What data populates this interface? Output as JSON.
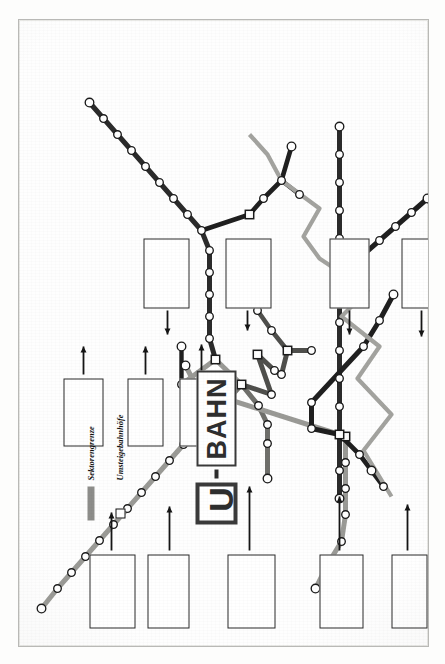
{
  "document": {
    "title": "U-Bahn",
    "subtitle": "BAHN",
    "orientation": "rotated-90-ccw",
    "paper_color": "#fefefe",
    "ink_color": "#1d1d1d"
  },
  "legend": {
    "items": [
      {
        "symbol": "bar",
        "label": "Sektorengrenze",
        "color": "#8d8d8a"
      },
      {
        "symbol": "square",
        "label": "Umsteigebahnhöfe",
        "color": "#111111"
      }
    ]
  },
  "lines": [
    {
      "id": "A",
      "name": "Linie A",
      "color": "#9a9a96",
      "stroke": 5.0
    },
    {
      "id": "B",
      "name": "Linie B",
      "color": "#4f4f4c",
      "stroke": 5.0
    },
    {
      "id": "C",
      "name": "Linie C",
      "color": "#2b2b2b",
      "stroke": 5.0
    },
    {
      "id": "D",
      "name": "Linie D",
      "color": "#6f6f6b",
      "stroke": 5.0
    },
    {
      "id": "E",
      "name": "Linie E",
      "color": "#1f1f1f",
      "stroke": 5.0
    },
    {
      "id": "SEKTOR",
      "name": "Sektorengrenze",
      "color": "#a3a39f",
      "stroke": 4.0
    }
  ],
  "stations": [
    {
      "name": "Krumme Lanke",
      "x": 38,
      "y": 22,
      "type": "end",
      "lbl": "above",
      "u": true
    },
    {
      "name": "Onkel Toms Hütte",
      "x": 58,
      "y": 38,
      "type": "stop",
      "lbl": "above"
    },
    {
      "name": "Oskar-Helene-Heim",
      "x": 74,
      "y": 52,
      "type": "stop",
      "lbl": "above"
    },
    {
      "name": "Thielplatz",
      "x": 90,
      "y": 66,
      "type": "stop",
      "lbl": "above"
    },
    {
      "name": "Dahlem-Dorf",
      "x": 106,
      "y": 80,
      "type": "stop",
      "lbl": "above"
    },
    {
      "name": "Podbielskiallee",
      "x": 122,
      "y": 94,
      "type": "stop",
      "lbl": "above"
    },
    {
      "name": "Breitenbachpl.",
      "x": 138,
      "y": 108,
      "type": "stop",
      "lbl": "above"
    },
    {
      "name": "Rüdesheimer Pl.",
      "x": 154,
      "y": 122,
      "type": "stop",
      "lbl": "above"
    },
    {
      "name": "Heidelberger Pl.",
      "x": 170,
      "y": 136,
      "type": "stop",
      "lbl": "above"
    },
    {
      "name": "Fehrbelliner Pl.",
      "x": 186,
      "y": 150,
      "type": "stop",
      "lbl": "above"
    },
    {
      "name": "Hohenzollernpl.",
      "x": 202,
      "y": 164,
      "type": "stop",
      "lbl": "above"
    },
    {
      "name": "Spichernstr.",
      "x": 222,
      "y": 181,
      "type": "xchg",
      "lbl": "above",
      "u": true
    },
    {
      "name": "Kurfürstendamm",
      "x": 252,
      "y": 181,
      "type": "xchg",
      "lbl": "above",
      "u": true
    },
    {
      "name": "Uhlandstr.",
      "x": 281,
      "y": 166,
      "type": "end",
      "lbl": "above",
      "u": true
    },
    {
      "name": "Augsburger S.",
      "x": 243,
      "y": 205,
      "type": "stop",
      "lbl": "below"
    },
    {
      "name": "Wittenbergpl.",
      "x": 262,
      "y": 222,
      "type": "xchg",
      "lbl": "below",
      "u": true
    },
    {
      "name": "Nollendorfpl.",
      "x": 292,
      "y": 238,
      "type": "xchg",
      "lbl": "below",
      "u": true
    },
    {
      "name": "Kurfürstenstr.",
      "x": 276,
      "y": 255,
      "type": "stop",
      "lbl": "below"
    },
    {
      "name": "Bülowstr.",
      "x": 252,
      "y": 252,
      "type": "stop",
      "lbl": "below"
    },
    {
      "name": "Viktoria-Luise-Pl.",
      "x": 241,
      "y": 239,
      "type": "stop",
      "lbl": "below"
    },
    {
      "name": "Bayer. Pl.",
      "x": 222,
      "y": 248,
      "type": "stop",
      "lbl": "below"
    },
    {
      "name": "Rath. Schöneberg",
      "x": 203,
      "y": 248,
      "type": "stop",
      "lbl": "below"
    },
    {
      "name": "Innsbrucker Pl.",
      "x": 168,
      "y": 248,
      "type": "end",
      "lbl": "above",
      "u": true
    },
    {
      "name": "Deutsche Oper",
      "x": 262,
      "y": 162,
      "type": "stop",
      "lbl": "below",
      "u": true
    },
    {
      "name": "Richard-Wagner-Pl.",
      "x": 300,
      "y": 162,
      "type": "end",
      "lbl": "above",
      "u": true
    },
    {
      "name": "Zoolog. Garten",
      "x": 287,
      "y": 196,
      "type": "xchg",
      "lbl": "below"
    },
    {
      "name": "Hansapl.",
      "x": 308,
      "y": 190,
      "type": "stop",
      "lbl": "below"
    },
    {
      "name": "Turmstr.",
      "x": 330,
      "y": 190,
      "type": "stop",
      "lbl": "below"
    },
    {
      "name": "Birkenstr.",
      "x": 352,
      "y": 190,
      "type": "stop",
      "lbl": "below"
    },
    {
      "name": "Bhf. Putlitzstr.",
      "x": 374,
      "y": 190,
      "type": "stop",
      "lbl": "below"
    },
    {
      "name": "Amrumer Str.",
      "x": 396,
      "y": 190,
      "type": "stop",
      "lbl": "below"
    },
    {
      "name": "Seestr.",
      "x": 416,
      "y": 182,
      "type": "stop",
      "lbl": "above"
    },
    {
      "name": "Rehberge",
      "x": 432,
      "y": 168,
      "type": "stop",
      "lbl": "above"
    },
    {
      "name": "Afrikanische Str.",
      "x": 448,
      "y": 154,
      "type": "stop",
      "lbl": "above",
      "u": true
    },
    {
      "name": "Kurt-Schumacher-Pl.",
      "x": 464,
      "y": 140,
      "type": "stop",
      "lbl": "above"
    },
    {
      "name": "Scharnweberstr.",
      "x": 480,
      "y": 126,
      "type": "stop",
      "lbl": "above"
    },
    {
      "name": "Seidelstr.",
      "x": 496,
      "y": 112,
      "type": "stop",
      "lbl": "above"
    },
    {
      "name": "Holzhauser Str.",
      "x": 512,
      "y": 98,
      "type": "stop",
      "lbl": "above"
    },
    {
      "name": "Borsigwerke",
      "x": 528,
      "y": 84,
      "type": "stop",
      "lbl": "above"
    },
    {
      "name": "Tegel",
      "x": 544,
      "y": 70,
      "type": "end",
      "lbl": "above"
    },
    {
      "name": "Neu-Westend",
      "x": 105,
      "y": 322,
      "type": "stop",
      "lbl": "below"
    },
    {
      "name": "Olympia-Stadion",
      "x": 82,
      "y": 308,
      "type": "stop",
      "lbl": "below"
    },
    {
      "name": "Ruhleben",
      "x": 58,
      "y": 296,
      "type": "end",
      "lbl": "below"
    },
    {
      "name": "Reichskanzlerpl.",
      "x": 132,
      "y": 326,
      "type": "stop",
      "lbl": "below",
      "u": true
    },
    {
      "name": "Kaiserdamm",
      "x": 158,
      "y": 326,
      "type": "stop",
      "lbl": "below"
    },
    {
      "name": "Sophie-Charlotte-Pl.",
      "x": 184,
      "y": 326,
      "type": "stop",
      "lbl": "below"
    },
    {
      "name": "Bismarckstr.",
      "x": 210,
      "y": 326,
      "type": "xchg",
      "lbl": "below"
    },
    {
      "name": "Leopoldpl.",
      "x": 432,
      "y": 230,
      "type": "xchg",
      "lbl": "above"
    },
    {
      "name": "Bhf. Wedding",
      "x": 448,
      "y": 244,
      "type": "stop",
      "lbl": "above"
    },
    {
      "name": "Voltastr.",
      "x": 466,
      "y": 262,
      "type": "stop",
      "lbl": "above"
    },
    {
      "name": "Bernauer Str.",
      "x": 452,
      "y": 280,
      "type": "stop",
      "lbl": "above"
    },
    {
      "name": "Gesundbrunnen",
      "x": 500,
      "y": 272,
      "type": "end",
      "lbl": "above",
      "u": true
    },
    {
      "name": "Pankow (Vinetastr.)",
      "x": 520,
      "y": 320,
      "type": "end",
      "lbl": "above",
      "u": true
    },
    {
      "name": "Schönhauser Allee",
      "x": 492,
      "y": 320,
      "type": "stop",
      "lbl": "above"
    },
    {
      "name": "Dimitroff Str.",
      "x": 464,
      "y": 320,
      "type": "stop",
      "lbl": "above"
    },
    {
      "name": "Senefelderplatz",
      "x": 436,
      "y": 320,
      "type": "stop",
      "lbl": "above"
    },
    {
      "name": "Rosa-Luxemburg-Pl.",
      "x": 408,
      "y": 320,
      "type": "stop",
      "lbl": "above"
    },
    {
      "name": "Alexanderplatz",
      "x": 380,
      "y": 320,
      "type": "xchg",
      "lbl": "above"
    },
    {
      "name": "Klosterstr.",
      "x": 352,
      "y": 320,
      "type": "stop",
      "lbl": "above"
    },
    {
      "name": "Jannowitzbrücke",
      "x": 324,
      "y": 320,
      "type": "stop",
      "lbl": "above"
    },
    {
      "name": "Heinrich-Heine-Str.",
      "x": 296,
      "y": 320,
      "type": "stop",
      "lbl": "above"
    },
    {
      "name": "Moritzplatz",
      "x": 268,
      "y": 320,
      "type": "stop",
      "lbl": "above"
    },
    {
      "name": "Kottbusser Damm",
      "x": 240,
      "y": 320,
      "type": "stop",
      "lbl": "above"
    },
    {
      "name": "Hermannplatz",
      "x": 212,
      "y": 320,
      "type": "xchg",
      "lbl": "above"
    },
    {
      "name": "Boddinstr.",
      "x": 176,
      "y": 320,
      "type": "stop",
      "lbl": "above"
    },
    {
      "name": "Leinestr.",
      "x": 148,
      "y": 320,
      "type": "end",
      "lbl": "above",
      "u": true
    },
    {
      "name": "Südstern",
      "x": 218,
      "y": 292,
      "type": "stop",
      "lbl": "above"
    },
    {
      "name": "Prinzenstr.",
      "x": 244,
      "y": 292,
      "type": "stop",
      "lbl": "above"
    },
    {
      "name": "Görlitzer Bhf.",
      "x": 300,
      "y": 344,
      "type": "stop",
      "lbl": "below"
    },
    {
      "name": "Schlesisches Tor",
      "x": 326,
      "y": 360,
      "type": "stop",
      "lbl": "below"
    },
    {
      "name": "Warschauer Br.",
      "x": 352,
      "y": 374,
      "type": "end",
      "lbl": "below"
    },
    {
      "name": "Bhf. Neukölln",
      "x": 176,
      "y": 352,
      "type": "end",
      "lbl": "below",
      "u": true
    },
    {
      "name": "Karl-Marx-Str.",
      "x": 192,
      "y": 340,
      "type": "stop",
      "lbl": "below"
    },
    {
      "name": "Neukölln (Südring)",
      "x": 160,
      "y": 364,
      "type": "stop",
      "lbl": "below"
    },
    {
      "name": "Stadtmitte",
      "x": 296,
      "y": 268,
      "type": "xchg",
      "lbl": "below",
      "u": true
    },
    {
      "name": "Kochstr.",
      "x": 296,
      "y": 292,
      "type": "stop",
      "lbl": "below"
    },
    {
      "name": "Französische Str.",
      "x": 316,
      "y": 252,
      "type": "stop",
      "lbl": "above"
    },
    {
      "name": "Bhf. Friedrichstr.",
      "x": 336,
      "y": 238,
      "type": "stop",
      "lbl": "above"
    },
    {
      "name": "Potsdamer Pl.",
      "x": 272,
      "y": 262,
      "type": "stop",
      "lbl": "below"
    },
    {
      "name": "Schillingstr.",
      "x": 392,
      "y": 344,
      "type": "stop",
      "lbl": "below"
    },
    {
      "name": "Strausberger Pl.",
      "x": 406,
      "y": 360,
      "type": "stop",
      "lbl": "below"
    },
    {
      "name": "Memeler Str.",
      "x": 420,
      "y": 376,
      "type": "stop",
      "lbl": "below"
    },
    {
      "name": "Frankfurter Tor",
      "x": 434,
      "y": 392,
      "type": "stop",
      "lbl": "below"
    },
    {
      "name": "Friedrichsfelde",
      "x": 448,
      "y": 408,
      "type": "end",
      "lbl": "below"
    }
  ],
  "notes": [
    {
      "id": "n1",
      "text": "Anschluß mit Wagen der 1. Fahrrichtung an den Bahnhof Zoologischer Garten und weiter auf der Achse",
      "x": 18,
      "y": 70,
      "w": 74,
      "h": 46
    },
    {
      "id": "n2",
      "text": "Anschluß nach Wannsee, Klosterstr., Bhf. Wedding, Seestraße und weiter in Richtung auf der Achse",
      "x": 18,
      "y": 128,
      "w": 74,
      "h": 42
    },
    {
      "id": "n3",
      "text": "Anschluß über 1. Fahrrichtung zur 2. Strecke weiter mit Straßenbahn zum Bahnhof Zoologischer Garten auf der Achse",
      "x": 18,
      "y": 208,
      "w": 74,
      "h": 48
    },
    {
      "id": "n4",
      "text": "Anschluß mit Wagen der 4. Fahrrichtung und Straßenbahn weiter zum Bahnhof auf der Achse",
      "x": 18,
      "y": 300,
      "w": 74,
      "h": 44
    },
    {
      "id": "n5",
      "text": "Anschluß an den Bahnhof mit der Straßenbahn",
      "x": 18,
      "y": 372,
      "w": 74,
      "h": 36
    },
    {
      "id": "n6",
      "text": "Anschluß nach BVG Bahnen mit Autobus auf der Straßenbahnlinie",
      "x": 18,
      "y": 432,
      "w": 74,
      "h": 38
    },
    {
      "id": "n7",
      "text": "Anschluß aus Richtung 4. Fahrtrichtung auf den Bahnhof in 7. Strecke",
      "x": 200,
      "y": 44,
      "w": 68,
      "h": 40
    },
    {
      "id": "n8",
      "text": "Anschluß auf der Straßenbahn auf den Bahnhof der Achse",
      "x": 200,
      "y": 108,
      "w": 68,
      "h": 36
    },
    {
      "id": "n9",
      "text": "Anschluß 4. Fahrrichtung Straßenbahn-Strecke zum Bahnhof in der Zone 7 Achse und weiter",
      "x": 200,
      "y": 160,
      "w": 68,
      "h": 46
    },
    {
      "id": "n10",
      "text": "Anschluß nach Tegeler & Reinigung: Fahrbetrieb Bernauer / Lichtenrade vorhanden Wittenau in 2. Achse",
      "x": 338,
      "y": 124,
      "w": 70,
      "h": 46
    },
    {
      "id": "n11",
      "text": "Anschluß 1. Richtung der Altbestand 2. Fahrweg weiter in Oberschöneweide mit dem Autobus",
      "x": 338,
      "y": 206,
      "w": 70,
      "h": 46
    },
    {
      "id": "n12",
      "text": "Anschluß 1. Fahrrichtung Mittelweg, Typ 4. Mittelstrecke mit 7. Autobus",
      "x": 338,
      "y": 310,
      "w": 70,
      "h": 40
    },
    {
      "id": "n13",
      "text": "Anschluß 1. Weiterverbindung zum Anschluß 4. Strecke weiter bis zur Stelle, wo die Strecke 1. Achse",
      "x": 338,
      "y": 382,
      "w": 70,
      "h": 44
    },
    {
      "id": "n14",
      "text": "Anschluß 4. Richtung zur Strecke Sperrzeit 4. Bahnhof, mit der Straßenbahn auf der Strecke der Achse",
      "x": 220,
      "y": 436,
      "w": 70,
      "h": 46
    },
    {
      "id": "n15",
      "text": "Anschluß 4. Sperrzeit in Stadtmitte, weiter auf der Achse",
      "x": 220,
      "y": 500,
      "w": 70,
      "h": 38
    },
    {
      "id": "n16",
      "text": "Anschluß auf Bhf. weiter mit der Straßenbahn",
      "x": 148,
      "y": 556,
      "w": 64,
      "h": 34
    }
  ],
  "arrows_count": 16
}
